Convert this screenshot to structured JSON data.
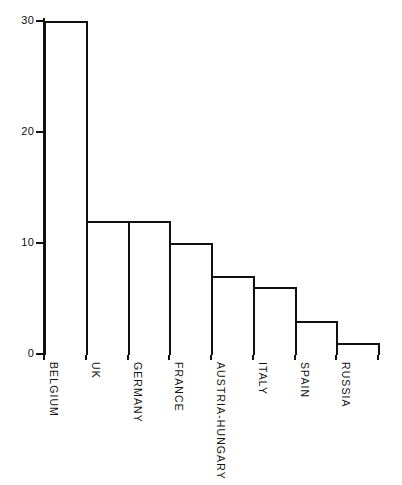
{
  "chart_data": {
    "type": "bar",
    "title": "",
    "subtitle": "",
    "xlabel": "",
    "ylabel": "",
    "categories": [
      "BELGIUM",
      "UK",
      "GERMANY",
      "FRANCE",
      "AUSTRIA-HUNGARY",
      "ITALY",
      "SPAIN",
      "RUSSIA"
    ],
    "values": [
      30,
      12,
      12,
      10,
      7,
      6,
      3,
      1
    ],
    "ylim": [
      0,
      30
    ],
    "yticks": [
      0,
      10,
      20,
      30
    ],
    "ytick_labels": [
      "0",
      "10",
      "20",
      "30"
    ],
    "grid": false,
    "legend": null,
    "orientation": "vertical",
    "bar_style": {
      "fill": "#ffffff",
      "edge": "#111111",
      "edge_width_px": 2
    },
    "axis_color": "#111111",
    "background": "#ffffff",
    "category_label_rotation_deg": 90,
    "annotations": []
  }
}
